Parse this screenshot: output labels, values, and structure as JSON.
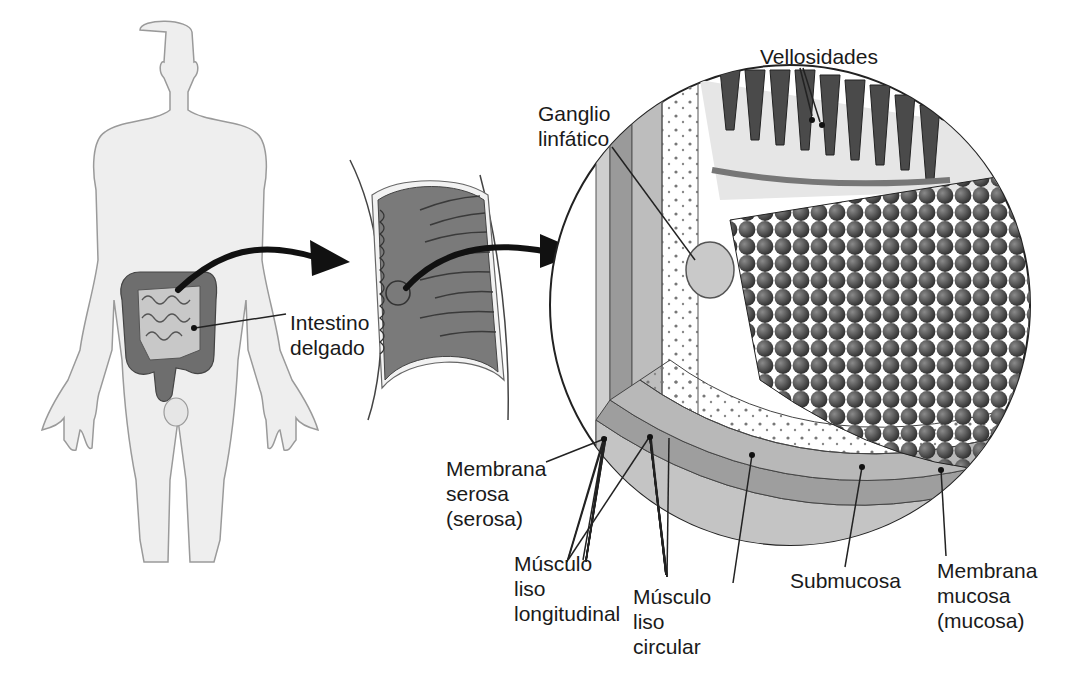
{
  "figure": {
    "language": "es",
    "panels": [
      {
        "id": "body",
        "description": "Human figure with digestive tract highlighted"
      },
      {
        "id": "intestine-segment",
        "description": "Cut section of small intestine showing circular folds"
      },
      {
        "id": "wall-detail",
        "description": "Circular magnified view of intestinal wall layers"
      }
    ]
  },
  "labels": {
    "intestino": "Intestino\ndelgado",
    "vellosidades": "Vellosidades",
    "ganglio": "Ganglio\nlinfático",
    "serosa": "Membrana\nserosa\n(serosa)",
    "longitudinal": "Músculo\nliso\nlongitudinal",
    "circular": "Músculo\nliso\ncircular",
    "submucosa": "Submucosa",
    "mucosa": "Membrana\nmucosa\n(mucosa)"
  },
  "colors": {
    "line": "#222222",
    "body_fill": "#eeeeee",
    "body_stroke": "#9a9a9a",
    "intestine_dark": "#6e6e6e",
    "intestine_mid": "#8c8c8c",
    "intestine_light": "#c8c8c8",
    "villi_dark": "#4a4a4a",
    "layer_light": "#d6d6d6"
  }
}
